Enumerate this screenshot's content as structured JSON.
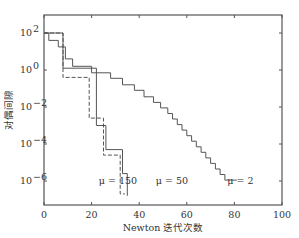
{
  "chart_data": {
    "type": "line",
    "title": "",
    "xlabel": "Newton 迭代次数",
    "ylabel": "对偶间隙",
    "xlim": [
      0,
      100
    ],
    "ylim_log10": [
      -7.2,
      2.9
    ],
    "yscale": "log",
    "grid": false,
    "x_ticks": [
      0,
      20,
      40,
      60,
      80,
      100
    ],
    "y_ticks": [
      {
        "exp": 2,
        "label": "10",
        "sup": "2"
      },
      {
        "exp": 0,
        "label": "10",
        "sup": "0"
      },
      {
        "exp": -2,
        "label": "10",
        "sup": "−2"
      },
      {
        "exp": -4,
        "label": "10",
        "sup": "−4"
      },
      {
        "exp": -6,
        "label": "10",
        "sup": "−6"
      }
    ],
    "series": [
      {
        "name": "μ=2",
        "style": "solid",
        "points": [
          [
            0,
            2
          ],
          [
            2,
            2
          ],
          [
            2,
            1.6
          ],
          [
            6,
            1.6
          ],
          [
            6,
            1.25
          ],
          [
            9,
            1.25
          ],
          [
            9,
            0.6
          ],
          [
            12,
            0.6
          ],
          [
            12,
            0.2
          ],
          [
            20,
            0.2
          ],
          [
            20,
            -0.15
          ],
          [
            28,
            -0.15
          ],
          [
            28,
            -0.45
          ],
          [
            33,
            -0.45
          ],
          [
            33,
            -0.8
          ],
          [
            38,
            -0.8
          ],
          [
            38,
            -1.1
          ],
          [
            42,
            -1.1
          ],
          [
            42,
            -1.45
          ],
          [
            46,
            -1.45
          ],
          [
            46,
            -1.75
          ],
          [
            49,
            -1.75
          ],
          [
            49,
            -2.05
          ],
          [
            52,
            -2.05
          ],
          [
            52,
            -2.35
          ],
          [
            54,
            -2.35
          ],
          [
            54,
            -2.65
          ],
          [
            56,
            -2.65
          ],
          [
            56,
            -2.95
          ],
          [
            58,
            -2.95
          ],
          [
            58,
            -3.25
          ],
          [
            60,
            -3.25
          ],
          [
            60,
            -3.55
          ],
          [
            62,
            -3.55
          ],
          [
            62,
            -3.85
          ],
          [
            64,
            -3.85
          ],
          [
            64,
            -4.15
          ],
          [
            66,
            -4.15
          ],
          [
            66,
            -4.45
          ],
          [
            68,
            -4.45
          ],
          [
            68,
            -4.75
          ],
          [
            70,
            -4.75
          ],
          [
            70,
            -5.05
          ],
          [
            72,
            -5.05
          ],
          [
            72,
            -5.35
          ],
          [
            74,
            -5.35
          ],
          [
            74,
            -5.65
          ],
          [
            76,
            -5.65
          ],
          [
            76,
            -5.95
          ],
          [
            81,
            -5.95
          ]
        ]
      },
      {
        "name": "μ=50",
        "style": "dashed",
        "points": [
          [
            0,
            2
          ],
          [
            8,
            2
          ],
          [
            8,
            -0.4
          ],
          [
            19,
            -0.4
          ],
          [
            19,
            -2.6
          ],
          [
            25,
            -2.6
          ],
          [
            25,
            -4.6
          ],
          [
            32,
            -4.6
          ],
          [
            32,
            -6.7
          ],
          [
            34,
            -6.7
          ]
        ]
      },
      {
        "name": "μ=150",
        "style": "solid",
        "points": [
          [
            0,
            2
          ],
          [
            8,
            2
          ],
          [
            8,
            0.1
          ],
          [
            22,
            0.1
          ],
          [
            22,
            -3.0
          ],
          [
            26,
            -3.0
          ],
          [
            26,
            -4.3
          ],
          [
            33,
            -4.3
          ],
          [
            33,
            -5.6
          ],
          [
            35,
            -5.6
          ],
          [
            35,
            -6.8
          ]
        ]
      }
    ],
    "annotations": [
      {
        "text": "μ = 150",
        "x": 23,
        "y_exp": -6.0
      },
      {
        "text": "μ = 50",
        "x": 47,
        "y_exp": -6.0
      },
      {
        "text": "μ = 2",
        "x": 77,
        "y_exp": -6.0
      }
    ]
  }
}
